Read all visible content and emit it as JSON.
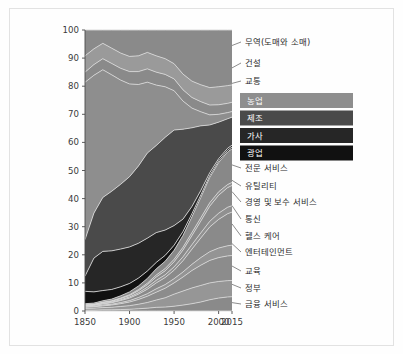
{
  "figure": {
    "background_color": "#fefefe",
    "frame_color": "#e2e2e2",
    "band_separator_color": "#d8d8d8"
  },
  "chart_data": {
    "type": "area",
    "title": "",
    "subtitle": "",
    "xlabel": "",
    "ylabel": "",
    "stacked": true,
    "normalized": true,
    "grid": false,
    "legend_position": "right-inset",
    "xlim": [
      1850,
      2015
    ],
    "ylim": [
      0,
      100
    ],
    "x_tick_labels": [
      "1850",
      "1900",
      "1950",
      "2000",
      "2015"
    ],
    "x_ticks": [
      1850,
      1900,
      1950,
      2000,
      2015
    ],
    "y_tick_labels": [
      "0",
      "10",
      "20",
      "30",
      "40",
      "50",
      "60",
      "70",
      "80",
      "90",
      "100"
    ],
    "y_ticks": [
      0,
      10,
      20,
      30,
      40,
      50,
      60,
      70,
      80,
      90,
      100
    ],
    "x": [
      1850,
      1860,
      1870,
      1880,
      1890,
      1900,
      1910,
      1920,
      1930,
      1940,
      1950,
      1960,
      1970,
      1980,
      1990,
      2000,
      2010,
      2015
    ],
    "series": [
      {
        "name": "금융 서비스",
        "color": "#8a8a8a",
        "values": [
          0.3,
          0.3,
          0.4,
          0.4,
          0.5,
          0.6,
          0.8,
          1.0,
          1.3,
          1.4,
          1.7,
          2.1,
          2.6,
          3.2,
          4.0,
          4.6,
          5.0,
          5.1
        ]
      },
      {
        "name": "정부",
        "color": "#969696",
        "values": [
          0.6,
          0.7,
          0.8,
          0.9,
          1.1,
          1.3,
          1.6,
          2.0,
          2.6,
          3.3,
          4.3,
          5.0,
          5.6,
          5.9,
          6.0,
          5.9,
          5.8,
          5.8
        ]
      },
      {
        "name": "교육",
        "color": "#8c8c8c",
        "values": [
          0.4,
          0.5,
          0.6,
          0.8,
          1.0,
          1.3,
          1.7,
          2.2,
          2.8,
          3.4,
          4.0,
          5.0,
          6.2,
          7.2,
          8.0,
          8.5,
          8.8,
          8.9
        ]
      },
      {
        "name": "엔터테인먼트",
        "color": "#949494",
        "values": [
          0.2,
          0.2,
          0.3,
          0.3,
          0.4,
          0.5,
          0.7,
          0.9,
          1.2,
          1.3,
          1.5,
          1.8,
          2.2,
          2.7,
          3.1,
          3.4,
          3.6,
          3.7
        ]
      },
      {
        "name": "헬스 케어",
        "color": "#8a8a8a",
        "values": [
          0.3,
          0.3,
          0.4,
          0.5,
          0.7,
          0.9,
          1.2,
          1.6,
          2.1,
          2.5,
          3.0,
          4.0,
          5.4,
          7.0,
          8.8,
          10.2,
          11.4,
          11.8
        ]
      },
      {
        "name": "통신",
        "color": "#909090",
        "values": [
          0.1,
          0.1,
          0.2,
          0.2,
          0.3,
          0.4,
          0.5,
          0.7,
          0.9,
          1.0,
          1.2,
          1.4,
          1.6,
          1.8,
          2.0,
          2.2,
          2.3,
          2.3
        ]
      },
      {
        "name": "경영 및 보수 서비스",
        "color": "#8a8a8a",
        "values": [
          0.2,
          0.2,
          0.3,
          0.3,
          0.4,
          0.5,
          0.7,
          0.9,
          1.2,
          1.4,
          1.8,
          2.4,
          3.2,
          4.2,
          5.4,
          6.4,
          7.0,
          7.2
        ]
      },
      {
        "name": "유틸리티",
        "color": "#929292",
        "values": [
          0.1,
          0.1,
          0.1,
          0.2,
          0.2,
          0.3,
          0.4,
          0.5,
          0.7,
          0.8,
          0.9,
          1.0,
          1.1,
          1.2,
          1.2,
          1.2,
          1.1,
          1.1
        ]
      },
      {
        "name": "전문 서비스",
        "color": "#888888",
        "values": [
          0.4,
          0.4,
          0.5,
          0.6,
          0.8,
          1.0,
          1.3,
          1.7,
          2.2,
          2.6,
          3.2,
          4.2,
          5.6,
          7.2,
          9.0,
          10.4,
          11.6,
          12.0
        ]
      },
      {
        "name": "광업",
        "color": "#111111",
        "values": [
          4.4,
          4.0,
          3.6,
          3.4,
          3.2,
          3.0,
          2.8,
          2.6,
          2.3,
          2.1,
          1.8,
          1.4,
          1.1,
          0.9,
          0.7,
          0.6,
          0.6,
          0.6
        ]
      },
      {
        "name": "가사",
        "color": "#262626",
        "values": [
          5.4,
          12.0,
          13.8,
          13.6,
          13.4,
          13.0,
          12.4,
          11.6,
          10.6,
          9.0,
          7.0,
          4.4,
          2.6,
          1.6,
          1.0,
          0.8,
          0.7,
          0.7
        ]
      },
      {
        "name": "제조",
        "color": "#4a4a4a",
        "values": [
          13.0,
          16.0,
          19.0,
          21.0,
          23.0,
          25.0,
          27.5,
          30.0,
          31.0,
          33.0,
          34.0,
          32.0,
          28.0,
          23.0,
          17.0,
          13.0,
          10.5,
          10.0
        ]
      },
      {
        "name": "농업",
        "color": "#8e8e8e",
        "values": [
          56.0,
          49.0,
          45.0,
          41.0,
          37.0,
          33.0,
          29.0,
          25.0,
          21.5,
          18.0,
          14.0,
          10.0,
          7.0,
          5.0,
          3.6,
          2.8,
          2.2,
          2.0
        ]
      },
      {
        "name": "교통",
        "color": "#8a8a8a",
        "values": [
          3.6,
          3.8,
          3.9,
          4.0,
          4.2,
          4.4,
          4.6,
          4.7,
          4.6,
          4.4,
          4.2,
          4.0,
          3.8,
          3.6,
          3.5,
          3.4,
          3.3,
          3.3
        ]
      },
      {
        "name": "건설",
        "color": "#9a9a9a",
        "values": [
          5.8,
          5.6,
          5.4,
          5.4,
          5.4,
          5.4,
          5.6,
          5.8,
          5.8,
          5.6,
          5.4,
          5.6,
          5.8,
          6.0,
          6.2,
          6.4,
          6.3,
          6.2
        ]
      },
      {
        "name": "무역(도매와 소매)",
        "color": "#8a8a8a",
        "values": [
          9.2,
          6.7,
          4.7,
          6.4,
          8.2,
          9.4,
          9.2,
          7.9,
          9.2,
          10.2,
          12.0,
          15.7,
          18.2,
          19.5,
          20.5,
          20.2,
          19.8,
          19.6
        ]
      }
    ],
    "annotations": [
      {
        "label": "무역(도매와 소매)",
        "y_value": 95.0
      },
      {
        "label": "건설",
        "y_value": 86.0
      },
      {
        "label": "교통",
        "y_value": 79.5
      },
      {
        "label": "전문 서비스",
        "y_value": 52.0
      },
      {
        "label": "유틸리티",
        "y_value": 45.5
      },
      {
        "label": "경영 및 보수 서비스",
        "y_value": 40.0
      },
      {
        "label": "통신",
        "y_value": 33.5
      },
      {
        "label": "헬스 케어",
        "y_value": 27.0
      },
      {
        "label": "엔터테인먼트",
        "y_value": 22.0
      },
      {
        "label": "교육",
        "y_value": 15.5
      },
      {
        "label": "정부",
        "y_value": 9.0
      },
      {
        "label": "금융 서비스",
        "y_value": 3.0
      }
    ],
    "legend": [
      {
        "label": "농업",
        "color": "#8e8e8e"
      },
      {
        "label": "제조",
        "color": "#4a4a4a"
      },
      {
        "label": "가사",
        "color": "#262626"
      },
      {
        "label": "광업",
        "color": "#111111"
      }
    ]
  }
}
